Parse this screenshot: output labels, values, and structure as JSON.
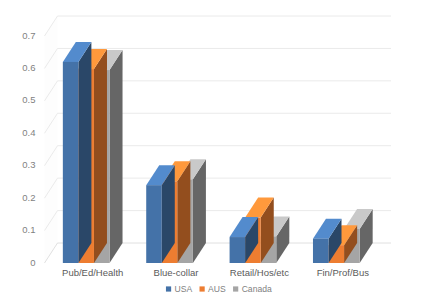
{
  "chart_data": {
    "type": "bar",
    "title": "",
    "subtitle": "",
    "xlabel": "",
    "ylabel": "",
    "categories": [
      "Pub/Ed/Health",
      "Blue-collar",
      "Retail/Hos/etc",
      "Fin/Prof/Bus"
    ],
    "series": [
      {
        "name": "USA",
        "color": "#4472a8",
        "values": [
          0.62,
          0.24,
          0.08,
          0.075
        ]
      },
      {
        "name": "AUS",
        "color": "#ed7d31",
        "values": [
          0.598,
          0.252,
          0.14,
          0.055
        ]
      },
      {
        "name": "Canada",
        "color": "#a5a5a5",
        "values": [
          0.595,
          0.258,
          0.082,
          0.105
        ]
      }
    ],
    "yticks": [
      "0",
      "0.1",
      "0.2",
      "0.3",
      "0.4",
      "0.5",
      "0.6",
      "0.7"
    ],
    "ytick_values": [
      0,
      0.1,
      0.2,
      0.3,
      0.4,
      0.5,
      0.6,
      0.7
    ],
    "ylim": [
      0,
      0.7
    ],
    "grid": true,
    "grid_axis": "y",
    "legend": {
      "position": "bottom",
      "entries": [
        {
          "label": "USA",
          "color": "#4472a8"
        },
        {
          "label": "AUS",
          "color": "#ed7d31"
        },
        {
          "label": "Canada",
          "color": "#a5a5a5"
        }
      ]
    },
    "style": {
      "three_d": true,
      "gridline_color": "#e8e8e8",
      "tick_label_color": "#7f7f7f",
      "category_label_color": "#5a5a5a",
      "plot_background": "#ffffff",
      "side_shade_usa": "#2f5075",
      "side_shade_aus": "#a8561f",
      "side_shade_canada": "#4a4e52",
      "top_shade_usa": "#5b8cc8",
      "top_shade_aus": "#f29a5c",
      "top_shade_canada": "#bdbdbd"
    }
  }
}
